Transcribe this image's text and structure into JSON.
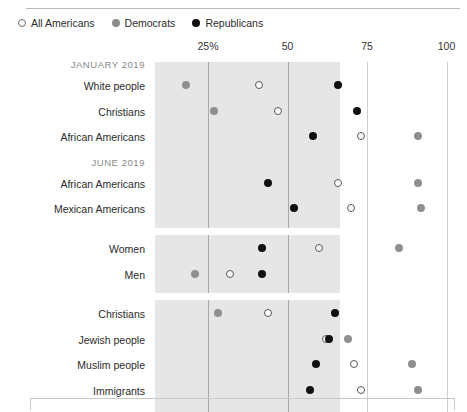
{
  "figure": {
    "clipped_top_text": "",
    "legend": [
      {
        "label": "All Americans",
        "marker": "open-circle",
        "color": "#ffffff"
      },
      {
        "label": "Democrats",
        "marker": "filled-circle",
        "color": "#8f8f8f"
      },
      {
        "label": "Republicans",
        "marker": "filled-circle",
        "color": "#111111"
      }
    ]
  },
  "chart_data": {
    "type": "scatter",
    "title": "",
    "xlabel": "",
    "ylabel": "",
    "xlim": [
      0,
      100
    ],
    "tick_labels": [
      "25%",
      "50",
      "75",
      "100"
    ],
    "ticks": [
      25,
      50,
      75,
      100
    ],
    "grid": true,
    "legend_position": "top-left",
    "series": [
      {
        "name": "All Americans",
        "marker": "open-circle",
        "color": "#ffffff"
      },
      {
        "name": "Democrats",
        "marker": "filled-circle",
        "color": "#8f8f8f"
      },
      {
        "name": "Republicans",
        "marker": "filled-circle",
        "color": "#111111"
      }
    ],
    "groups": [
      {
        "label": "JANUARY 2019",
        "rows": [
          {
            "category": "White people",
            "All Americans": 41,
            "Democrats": 18,
            "Republicans": 66
          },
          {
            "category": "Christians",
            "All Americans": 47,
            "Democrats": 27,
            "Republicans": 72
          },
          {
            "category": "African Americans",
            "All Americans": 73,
            "Democrats": 91,
            "Republicans": 58
          }
        ]
      },
      {
        "label": "JUNE 2019",
        "rows": [
          {
            "category": "African Americans",
            "All Americans": 66,
            "Democrats": 91,
            "Republicans": 44
          },
          {
            "category": "Mexican Americans",
            "All Americans": 70,
            "Democrats": 92,
            "Republicans": 52
          }
        ]
      },
      {
        "label": "",
        "rows": [
          {
            "category": "Women",
            "All Americans": 60,
            "Democrats": 85,
            "Republicans": 42
          },
          {
            "category": "Men",
            "All Americans": 32,
            "Democrats": 21,
            "Republicans": 42
          }
        ]
      },
      {
        "label": "",
        "rows": [
          {
            "category": "Christians",
            "All Americans": 44,
            "Democrats": 28,
            "Republicans": 65
          },
          {
            "category": "Jewish people",
            "All Americans": 62,
            "Democrats": 69,
            "Republicans": 63
          },
          {
            "category": "Muslim people",
            "All Americans": 71,
            "Democrats": 89,
            "Republicans": 59
          },
          {
            "category": "Immigrants",
            "All Americans": 73,
            "Democrats": 91,
            "Republicans": 57
          }
        ]
      }
    ]
  }
}
